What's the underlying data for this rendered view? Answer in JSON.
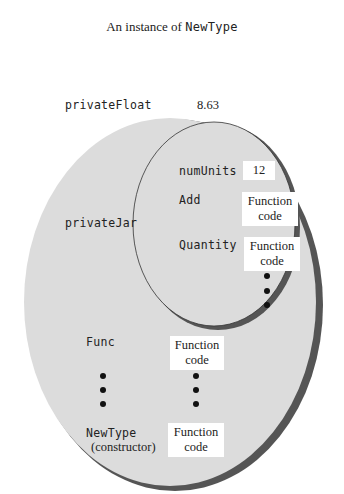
{
  "title": {
    "prefix": "An instance of ",
    "type_name": "NewType"
  },
  "outer": {
    "members": [
      {
        "name": "privateFloat",
        "value": "8.63"
      },
      {
        "name": "privateJar"
      },
      {
        "name": "Func",
        "value_line1": "Function",
        "value_line2": "code"
      },
      {
        "name": "NewType",
        "sub": "(constructor)",
        "value_line1": "Function",
        "value_line2": "code"
      }
    ]
  },
  "inner": {
    "members": [
      {
        "name": "numUnits",
        "value": "12"
      },
      {
        "name": "Add",
        "value_line1": "Function",
        "value_line2": "code"
      },
      {
        "name": "Quantity",
        "value_line1": "Function",
        "value_line2": "code"
      }
    ]
  },
  "colors": {
    "ellipse_fill": "#dcdcdc",
    "shadow": "#555555",
    "box": "#ffffff"
  }
}
